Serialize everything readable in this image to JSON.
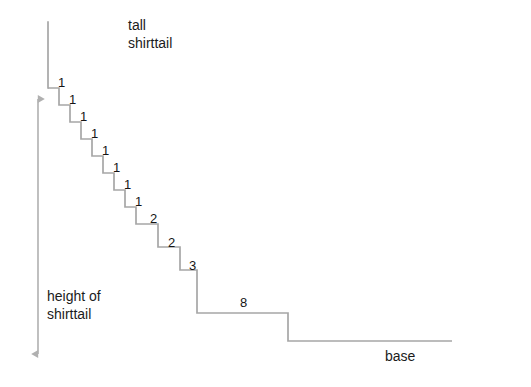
{
  "diagram": {
    "title_note": "tall shirttail",
    "captions": {
      "tall_shirttail": "tall\nshirttail",
      "height_of_shirttail": "height of\nshirttail",
      "base": "base"
    },
    "colors": {
      "line": "#a6a6a6",
      "arrow": "#b0b0b0",
      "text": "#1b1b1b",
      "background": "#ffffff"
    },
    "step_labels": [
      {
        "value": "1",
        "x": 58,
        "y": 75
      },
      {
        "value": "1",
        "x": 69,
        "y": 93
      },
      {
        "value": "1",
        "x": 80,
        "y": 110
      },
      {
        "value": "1",
        "x": 91,
        "y": 127
      },
      {
        "value": "1",
        "x": 102,
        "y": 144
      },
      {
        "value": "1",
        "x": 113,
        "y": 161
      },
      {
        "value": "1",
        "x": 124,
        "y": 178
      },
      {
        "value": "1",
        "x": 135,
        "y": 195
      },
      {
        "value": "2",
        "x": 150,
        "y": 213
      },
      {
        "value": "2",
        "x": 168,
        "y": 238
      },
      {
        "value": "3",
        "x": 189,
        "y": 264
      },
      {
        "value": "8",
        "x": 240,
        "y": 289
      }
    ],
    "labels_summary": {
      "ones_count": 8,
      "sequence": [
        "1",
        "1",
        "1",
        "1",
        "1",
        "1",
        "1",
        "1",
        "2",
        "2",
        "3",
        "8"
      ]
    },
    "geometry": {
      "tall_line": {
        "x": 48,
        "y_top": 22,
        "y_bottom": 88
      },
      "height_arrow": {
        "x": 38,
        "y_top": 97,
        "y_bottom": 356
      },
      "base_line": {
        "y": 341,
        "x_left": 288,
        "x_right": 452
      },
      "staircase_start": {
        "x": 48,
        "y": 88
      },
      "small_step": {
        "dx": 11,
        "dy": 17,
        "count": 8
      },
      "steps": [
        {
          "label": "1",
          "width": 11,
          "drop": 17
        },
        {
          "label": "1",
          "width": 11,
          "drop": 17
        },
        {
          "label": "1",
          "width": 11,
          "drop": 17
        },
        {
          "label": "1",
          "width": 11,
          "drop": 17
        },
        {
          "label": "1",
          "width": 11,
          "drop": 17
        },
        {
          "label": "1",
          "width": 11,
          "drop": 17
        },
        {
          "label": "1",
          "width": 11,
          "drop": 17
        },
        {
          "label": "1",
          "width": 11,
          "drop": 17
        },
        {
          "label": "2",
          "width": 22,
          "drop": 23
        },
        {
          "label": "2",
          "width": 22,
          "drop": 23
        },
        {
          "label": "3",
          "width": 33,
          "drop": 24
        },
        {
          "label": "8",
          "width": 91,
          "drop": 28
        }
      ]
    },
    "caption_positions": {
      "tall_shirttail": {
        "x": 128,
        "y": 18
      },
      "height_of_shirttail": {
        "x": 47,
        "y": 288
      },
      "base": {
        "x": 385,
        "y": 348
      }
    }
  }
}
